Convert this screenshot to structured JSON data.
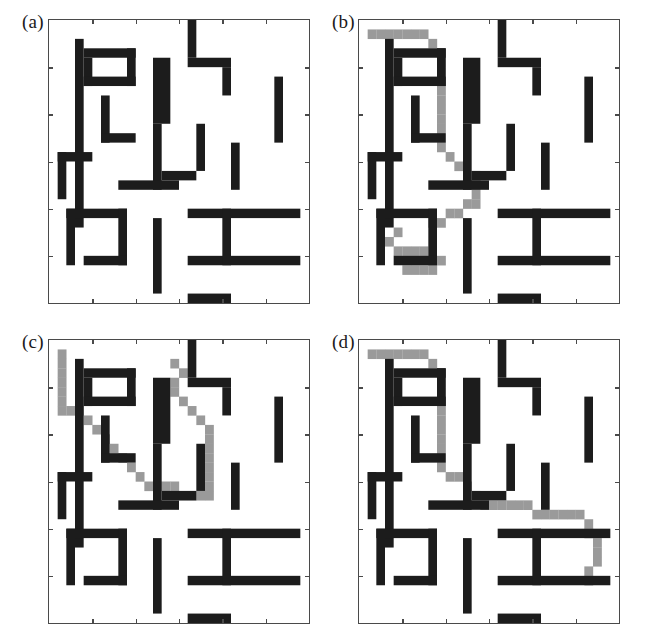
{
  "figure": {
    "width": 660,
    "height": 641,
    "background": "#ffffff"
  },
  "colors": {
    "obstacle": "#1c1c1c",
    "path": "#9a9a9a",
    "free": "#ffffff",
    "frame": "#4a4a4a",
    "label": "#1a1a1a"
  },
  "grid": {
    "cols": 30,
    "rows": 30,
    "cell_px": 8.67,
    "axis_ticks_x": 5,
    "axis_ticks_y": 5,
    "x_range": [
      0,
      30
    ],
    "y_range": [
      0,
      30
    ]
  },
  "panels": [
    {
      "id": "a",
      "label": "(a)",
      "left": 20,
      "top": 12,
      "has_path": false,
      "path_label": "",
      "obstacles": [
        [
          3,
          2,
          1,
          20
        ],
        [
          16,
          0,
          1,
          4
        ],
        [
          16,
          4,
          5,
          1
        ],
        [
          20,
          5,
          1,
          3
        ],
        [
          26,
          6,
          1,
          7
        ],
        [
          4,
          3,
          6,
          1
        ],
        [
          9,
          3,
          1,
          4
        ],
        [
          4,
          4,
          1,
          3
        ],
        [
          4,
          6,
          6,
          1
        ],
        [
          6,
          8,
          1,
          5
        ],
        [
          6,
          12,
          4,
          1
        ],
        [
          12,
          4,
          2,
          7
        ],
        [
          12,
          11,
          1,
          7
        ],
        [
          17,
          11,
          1,
          5
        ],
        [
          13,
          16,
          4,
          1
        ],
        [
          21,
          13,
          1,
          5
        ],
        [
          1,
          14,
          1,
          5
        ],
        [
          1,
          14,
          4,
          1
        ],
        [
          8,
          17,
          7,
          1
        ],
        [
          2,
          20,
          7,
          1
        ],
        [
          8,
          20,
          1,
          6
        ],
        [
          4,
          25,
          5,
          1
        ],
        [
          2,
          20,
          1,
          6
        ],
        [
          12,
          21,
          1,
          8
        ],
        [
          16,
          20,
          13,
          1
        ],
        [
          16,
          25,
          13,
          1
        ],
        [
          20,
          20,
          1,
          6
        ],
        [
          16,
          29,
          5,
          2
        ]
      ]
    },
    {
      "id": "b",
      "label": "(b)",
      "left": 330,
      "top": 12,
      "has_path": true,
      "path_label": "planned path b",
      "obstacles": [
        [
          3,
          2,
          1,
          20
        ],
        [
          16,
          0,
          1,
          4
        ],
        [
          16,
          4,
          5,
          1
        ],
        [
          20,
          5,
          1,
          3
        ],
        [
          26,
          6,
          1,
          7
        ],
        [
          4,
          3,
          6,
          1
        ],
        [
          9,
          3,
          1,
          4
        ],
        [
          4,
          4,
          1,
          3
        ],
        [
          4,
          6,
          6,
          1
        ],
        [
          6,
          8,
          1,
          5
        ],
        [
          6,
          12,
          4,
          1
        ],
        [
          12,
          4,
          2,
          7
        ],
        [
          12,
          11,
          1,
          7
        ],
        [
          17,
          11,
          1,
          5
        ],
        [
          13,
          16,
          4,
          1
        ],
        [
          21,
          13,
          1,
          5
        ],
        [
          1,
          14,
          1,
          5
        ],
        [
          1,
          14,
          4,
          1
        ],
        [
          8,
          17,
          7,
          1
        ],
        [
          2,
          20,
          7,
          1
        ],
        [
          8,
          20,
          1,
          6
        ],
        [
          4,
          25,
          5,
          1
        ],
        [
          2,
          20,
          1,
          6
        ],
        [
          12,
          21,
          1,
          8
        ],
        [
          16,
          20,
          13,
          1
        ],
        [
          16,
          25,
          13,
          1
        ],
        [
          20,
          20,
          1,
          6
        ],
        [
          16,
          29,
          5,
          2
        ]
      ],
      "path": [
        [
          1,
          1
        ],
        [
          2,
          1
        ],
        [
          3,
          1
        ],
        [
          4,
          1
        ],
        [
          5,
          1
        ],
        [
          6,
          1
        ],
        [
          7,
          1
        ],
        [
          8,
          2
        ],
        [
          9,
          3
        ],
        [
          9,
          4
        ],
        [
          9,
          5
        ],
        [
          9,
          6
        ],
        [
          9,
          7
        ],
        [
          9,
          8
        ],
        [
          9,
          9
        ],
        [
          9,
          10
        ],
        [
          9,
          11
        ],
        [
          9,
          12
        ],
        [
          9,
          13
        ],
        [
          10,
          14
        ],
        [
          11,
          15
        ],
        [
          12,
          16
        ],
        [
          13,
          16
        ],
        [
          13,
          17
        ],
        [
          13,
          18
        ],
        [
          13,
          19
        ],
        [
          12,
          19
        ],
        [
          11,
          20
        ],
        [
          10,
          20
        ],
        [
          9,
          21
        ],
        [
          8,
          21
        ],
        [
          4,
          22
        ],
        [
          3,
          23
        ],
        [
          4,
          24
        ],
        [
          5,
          24
        ],
        [
          6,
          24
        ],
        [
          7,
          24
        ],
        [
          9,
          25
        ],
        [
          8,
          26
        ],
        [
          7,
          26
        ],
        [
          6,
          26
        ],
        [
          5,
          26
        ]
      ]
    },
    {
      "id": "c",
      "label": "(c)",
      "left": 20,
      "top": 332,
      "has_path": true,
      "path_label": "planned path c",
      "obstacles": [
        [
          3,
          2,
          1,
          20
        ],
        [
          16,
          0,
          1,
          4
        ],
        [
          16,
          4,
          5,
          1
        ],
        [
          20,
          5,
          1,
          3
        ],
        [
          26,
          6,
          1,
          7
        ],
        [
          4,
          3,
          6,
          1
        ],
        [
          9,
          3,
          1,
          4
        ],
        [
          4,
          4,
          1,
          3
        ],
        [
          4,
          6,
          6,
          1
        ],
        [
          6,
          8,
          1,
          5
        ],
        [
          6,
          12,
          4,
          1
        ],
        [
          12,
          4,
          2,
          7
        ],
        [
          12,
          11,
          1,
          7
        ],
        [
          17,
          11,
          1,
          5
        ],
        [
          13,
          16,
          4,
          1
        ],
        [
          21,
          13,
          1,
          5
        ],
        [
          1,
          14,
          1,
          5
        ],
        [
          1,
          14,
          4,
          1
        ],
        [
          8,
          17,
          7,
          1
        ],
        [
          2,
          20,
          7,
          1
        ],
        [
          8,
          20,
          1,
          6
        ],
        [
          4,
          25,
          5,
          1
        ],
        [
          2,
          20,
          1,
          6
        ],
        [
          12,
          21,
          1,
          8
        ],
        [
          16,
          20,
          13,
          1
        ],
        [
          16,
          25,
          13,
          1
        ],
        [
          20,
          20,
          1,
          6
        ],
        [
          16,
          29,
          5,
          2
        ]
      ],
      "path": [
        [
          1,
          1
        ],
        [
          1,
          2
        ],
        [
          1,
          3
        ],
        [
          1,
          4
        ],
        [
          1,
          5
        ],
        [
          1,
          6
        ],
        [
          1,
          7
        ],
        [
          2,
          7
        ],
        [
          3,
          7
        ],
        [
          4,
          8
        ],
        [
          5,
          9
        ],
        [
          6,
          10
        ],
        [
          7,
          11
        ],
        [
          8,
          12
        ],
        [
          9,
          13
        ],
        [
          10,
          14
        ],
        [
          11,
          15
        ],
        [
          12,
          15
        ],
        [
          13,
          15
        ],
        [
          14,
          15
        ],
        [
          15,
          16
        ],
        [
          16,
          16
        ],
        [
          17,
          16
        ],
        [
          18,
          16
        ],
        [
          18,
          15
        ],
        [
          18,
          14
        ],
        [
          18,
          13
        ],
        [
          18,
          12
        ],
        [
          18,
          11
        ],
        [
          18,
          10
        ],
        [
          18,
          9
        ],
        [
          17,
          8
        ],
        [
          16,
          7
        ],
        [
          15,
          6
        ],
        [
          14,
          5
        ],
        [
          14,
          4
        ],
        [
          15,
          3
        ],
        [
          14,
          2
        ]
      ]
    },
    {
      "id": "d",
      "label": "(d)",
      "left": 330,
      "top": 332,
      "has_path": true,
      "path_label": "planned path d",
      "obstacles": [
        [
          3,
          2,
          1,
          20
        ],
        [
          16,
          0,
          1,
          4
        ],
        [
          16,
          4,
          5,
          1
        ],
        [
          20,
          5,
          1,
          3
        ],
        [
          26,
          6,
          1,
          7
        ],
        [
          4,
          3,
          6,
          1
        ],
        [
          9,
          3,
          1,
          4
        ],
        [
          4,
          4,
          1,
          3
        ],
        [
          4,
          6,
          6,
          1
        ],
        [
          6,
          8,
          1,
          5
        ],
        [
          6,
          12,
          4,
          1
        ],
        [
          12,
          4,
          2,
          7
        ],
        [
          12,
          11,
          1,
          7
        ],
        [
          17,
          11,
          1,
          5
        ],
        [
          13,
          16,
          4,
          1
        ],
        [
          21,
          13,
          1,
          5
        ],
        [
          1,
          14,
          1,
          5
        ],
        [
          1,
          14,
          4,
          1
        ],
        [
          8,
          17,
          7,
          1
        ],
        [
          2,
          20,
          7,
          1
        ],
        [
          8,
          20,
          1,
          6
        ],
        [
          4,
          25,
          5,
          1
        ],
        [
          2,
          20,
          1,
          6
        ],
        [
          12,
          21,
          1,
          8
        ],
        [
          16,
          20,
          13,
          1
        ],
        [
          16,
          25,
          13,
          1
        ],
        [
          20,
          20,
          1,
          6
        ],
        [
          16,
          29,
          5,
          2
        ]
      ],
      "path": [
        [
          1,
          1
        ],
        [
          2,
          1
        ],
        [
          3,
          1
        ],
        [
          4,
          1
        ],
        [
          5,
          1
        ],
        [
          6,
          1
        ],
        [
          7,
          1
        ],
        [
          8,
          2
        ],
        [
          9,
          3
        ],
        [
          9,
          4
        ],
        [
          9,
          5
        ],
        [
          9,
          6
        ],
        [
          9,
          7
        ],
        [
          9,
          8
        ],
        [
          9,
          9
        ],
        [
          9,
          10
        ],
        [
          9,
          11
        ],
        [
          9,
          12
        ],
        [
          9,
          13
        ],
        [
          10,
          14
        ],
        [
          11,
          14
        ],
        [
          12,
          15
        ],
        [
          13,
          16
        ],
        [
          14,
          17
        ],
        [
          15,
          17
        ],
        [
          16,
          17
        ],
        [
          17,
          17
        ],
        [
          18,
          17
        ],
        [
          19,
          17
        ],
        [
          20,
          18
        ],
        [
          21,
          18
        ],
        [
          22,
          18
        ],
        [
          23,
          18
        ],
        [
          24,
          18
        ],
        [
          25,
          18
        ],
        [
          26,
          19
        ],
        [
          26,
          20
        ],
        [
          27,
          21
        ],
        [
          27,
          22
        ],
        [
          27,
          23
        ],
        [
          26,
          24
        ],
        [
          26,
          25
        ]
      ]
    }
  ]
}
